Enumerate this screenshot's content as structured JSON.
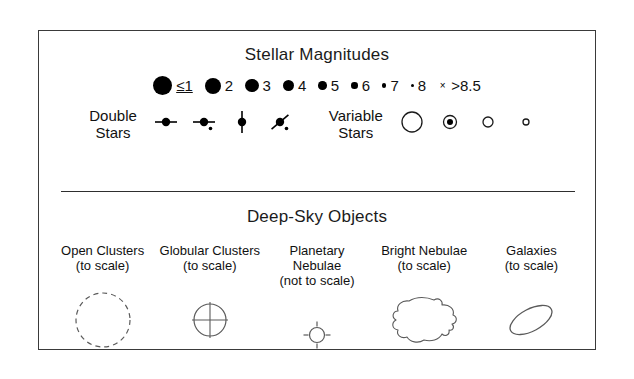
{
  "legend": {
    "stellar": {
      "title": "Stellar Magnitudes",
      "magnitudes": [
        {
          "label": "≤1",
          "size": 19,
          "icon": "filled-circle"
        },
        {
          "label": "2",
          "size": 16,
          "icon": "filled-circle"
        },
        {
          "label": "3",
          "size": 13.5,
          "icon": "filled-circle"
        },
        {
          "label": "4",
          "size": 11,
          "icon": "filled-circle"
        },
        {
          "label": "5",
          "size": 8.5,
          "icon": "filled-circle"
        },
        {
          "label": "6",
          "size": 6.5,
          "icon": "filled-circle"
        },
        {
          "label": "7",
          "size": 4.5,
          "icon": "filled-circle"
        },
        {
          "label": "8",
          "size": 3,
          "icon": "filled-circle"
        },
        {
          "label": ">8.5",
          "size": 9,
          "icon": "cross-mark",
          "glyph": "×"
        }
      ],
      "double_stars": {
        "label_line1": "Double",
        "label_line2": "Stars",
        "symbols": [
          {
            "icon": "double-star-horizontal",
            "angle": 0,
            "companion": false
          },
          {
            "icon": "double-star-horizontal-companion",
            "angle": 0,
            "companion": true
          },
          {
            "icon": "double-star-vertical",
            "angle": 90,
            "companion": false
          },
          {
            "icon": "double-star-diagonal",
            "angle": -40,
            "companion": true
          }
        ]
      },
      "variable_stars": {
        "label_line1": "Variable",
        "label_line2": "Stars",
        "symbols": [
          {
            "icon": "variable-star-open-large",
            "size": 20,
            "filled_center": 0
          },
          {
            "icon": "variable-star-filled-center",
            "size": 13,
            "filled_center": 6
          },
          {
            "icon": "variable-star-open-small",
            "size": 10,
            "filled_center": 0
          },
          {
            "icon": "variable-star-open-tiny",
            "size": 6,
            "filled_center": 0
          }
        ]
      }
    },
    "deep_sky": {
      "title": "Deep-Sky Objects",
      "objects": [
        {
          "name_line1": "Open Clusters",
          "name_line2": "(to scale)",
          "icon": "open-cluster-dashed-circle"
        },
        {
          "name_line1": "Globular Clusters",
          "name_line2": "(to scale)",
          "icon": "globular-cluster-crossed-circle"
        },
        {
          "name_line1": "Planetary",
          "name_line2": "Nebulae",
          "name_line3": "(not to scale)",
          "icon": "planetary-nebula-circle-ticks"
        },
        {
          "name_line1": "Bright Nebulae",
          "name_line2": "(to scale)",
          "icon": "bright-nebula-irregular-outline"
        },
        {
          "name_line1": "Galaxies",
          "name_line2": "(to scale)",
          "icon": "galaxy-ellipse"
        }
      ]
    },
    "colors": {
      "ink": "#000000",
      "border": "#3a3a3a",
      "background": "#ffffff",
      "outline": "#5a5a5a"
    }
  }
}
